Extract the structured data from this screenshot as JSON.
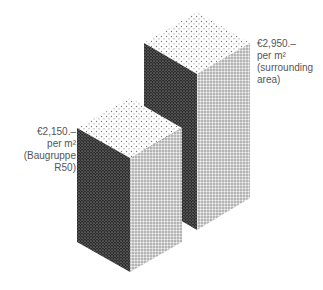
{
  "diagram": {
    "type": "isometric-price-comparison",
    "blocks": [
      {
        "id": "baugruppe",
        "label_lines": [
          "€2,150.–",
          "per m²",
          "(Baugruppe",
          "R50)"
        ],
        "price": "€2,150.–",
        "unit": "per m²",
        "description": "(Baugruppe R50)"
      },
      {
        "id": "surrounding",
        "label_lines": [
          "€2,950.–",
          "per m²",
          "(surrounding",
          "area)"
        ],
        "price": "€2,950.–",
        "unit": "per m²",
        "description": "(surrounding area)"
      }
    ],
    "colors": {
      "top_face": "#e6e6e6",
      "left_face": "#3a3a3a",
      "right_face": "#bdbdbd",
      "text": "#555555",
      "background": "#ffffff"
    }
  }
}
